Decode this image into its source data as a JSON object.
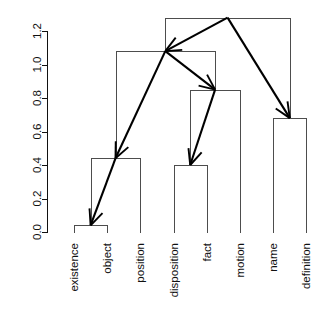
{
  "figure": {
    "title": "",
    "background_color": "#ffffff",
    "width": 329,
    "height": 316
  },
  "axis": {
    "name": "y-axis-height",
    "orientation": "vertical-left",
    "label": "",
    "tick_labels": [
      "0.0",
      "0.2",
      "0.4",
      "0.6",
      "0.8",
      "1.0",
      "1.2"
    ],
    "tick_values": [
      0.0,
      0.2,
      0.4,
      0.6,
      0.8,
      1.0,
      1.2
    ],
    "range": [
      0.0,
      1.2
    ],
    "color": "#111111"
  },
  "leaves": [
    {
      "label": "existence"
    },
    {
      "label": "object"
    },
    {
      "label": "position"
    },
    {
      "label": "disposition"
    },
    {
      "label": "fact"
    },
    {
      "label": "motion"
    },
    {
      "label": "name"
    },
    {
      "label": "definition"
    }
  ],
  "colors": {
    "tree": "#4d4d4d",
    "arrow": "#000000",
    "axis": "#111111",
    "background": "#ffffff"
  },
  "chart_data": {
    "type": "dendrogram",
    "title": "",
    "xlabel": "",
    "ylabel": "",
    "ylim": [
      0.0,
      1.2
    ],
    "grid": false,
    "legend": "none",
    "leaf_order": [
      "existence",
      "object",
      "position",
      "disposition",
      "fact",
      "motion",
      "name",
      "definition"
    ],
    "leaf_positions": [
      1,
      2,
      3,
      4,
      5,
      6,
      7,
      8
    ],
    "axis_ticks": [
      0.0,
      0.2,
      0.4,
      0.6,
      0.8,
      1.0,
      1.2
    ],
    "axis_tick_labels": [
      "0.0",
      "0.2",
      "0.4",
      "0.6",
      "0.8",
      "1.0",
      "1.2"
    ],
    "merges": [
      {
        "id": "m1",
        "height": 0.04,
        "x": 1.5,
        "left": "existence",
        "right": "object"
      },
      {
        "id": "m2",
        "height": 0.4,
        "x": 4.5,
        "left": "disposition",
        "right": "fact"
      },
      {
        "id": "m3",
        "height": 0.44,
        "x": 2.25,
        "left": "m1",
        "right": "position"
      },
      {
        "id": "m4",
        "height": 0.68,
        "x": 7.5,
        "left": "name",
        "right": "definition"
      },
      {
        "id": "m5",
        "height": 0.85,
        "x": 5.25,
        "left": "m2",
        "right": "motion"
      },
      {
        "id": "m6",
        "height": 1.08,
        "x": 3.75,
        "left": "m3",
        "right": "m5"
      },
      {
        "id": "m7",
        "height": 1.28,
        "x": 5.62,
        "left": "m6",
        "right": "m4"
      }
    ],
    "arrows": [
      {
        "from": "m7",
        "to": "m6",
        "label": "root-to-left-subtree"
      },
      {
        "from": "m7",
        "to": "m4",
        "label": "root-to-name-definition"
      },
      {
        "from": "m6",
        "to": "m3",
        "label": "node108-to-node044"
      },
      {
        "from": "m6",
        "to": "m5",
        "label": "node108-to-node085"
      },
      {
        "from": "m5",
        "to": "m2",
        "label": "node085-to-node040"
      },
      {
        "from": "m3",
        "to": "m1",
        "label": "node044-to-node004"
      }
    ]
  }
}
